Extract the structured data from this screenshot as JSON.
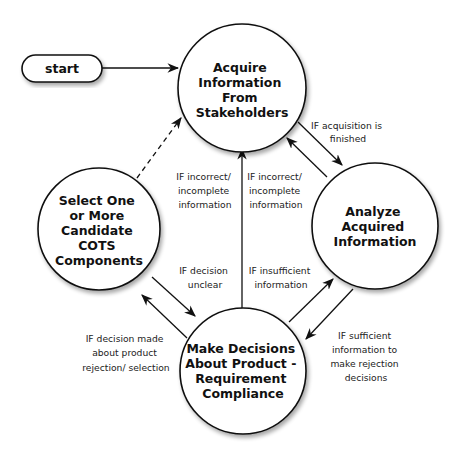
{
  "diagram": {
    "type": "state-flow",
    "start": {
      "label": "start"
    },
    "nodes": [
      {
        "id": "acquire",
        "lines": [
          "Acquire",
          "Information",
          "From",
          "Stakeholders"
        ]
      },
      {
        "id": "select",
        "lines": [
          "Select One",
          "or More",
          "Candidate",
          "COTS",
          "Components"
        ]
      },
      {
        "id": "analyze",
        "lines": [
          "Analyze",
          "Acquired",
          "Information"
        ]
      },
      {
        "id": "decide",
        "lines": [
          "Make Decisions",
          "About Product -",
          "Requirement",
          "Compliance"
        ]
      }
    ],
    "edges": [
      {
        "from": "start",
        "to": "acquire",
        "style": "solid",
        "label_lines": []
      },
      {
        "from": "select",
        "to": "acquire",
        "style": "dashed",
        "label_lines": []
      },
      {
        "from": "acquire",
        "to": "analyze",
        "style": "solid",
        "label_lines": [
          "IF acquisition is",
          "finished"
        ]
      },
      {
        "from": "analyze",
        "to": "acquire",
        "style": "solid",
        "label_lines": [
          "IF incorrect/",
          "incomplete",
          "information"
        ]
      },
      {
        "from": "decide",
        "to": "acquire",
        "style": "solid",
        "label_lines": [
          "IF incorrect/",
          "incomplete",
          "information"
        ]
      },
      {
        "from": "select",
        "to": "decide",
        "style": "solid",
        "label_lines": [
          "IF decision",
          "unclear"
        ]
      },
      {
        "from": "decide",
        "to": "analyze",
        "style": "solid",
        "label_lines": [
          "IF insufficient",
          "information"
        ]
      },
      {
        "from": "decide",
        "to": "select",
        "style": "solid",
        "label_lines": [
          "IF decision made",
          "about product",
          "rejection/ selection"
        ]
      },
      {
        "from": "analyze",
        "to": "decide",
        "style": "solid",
        "label_lines": [
          "IF sufficient",
          "information to",
          "make rejection",
          "decisions"
        ]
      }
    ]
  },
  "colors": {
    "stroke": "#111111",
    "background": "#ffffff",
    "shadow": "#bbbbbb"
  }
}
